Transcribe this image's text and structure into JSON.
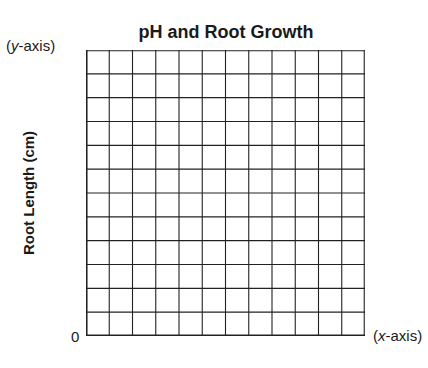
{
  "chart_data": {
    "type": "line",
    "title": "pH and Root Growth",
    "xlabel": "(x-axis)",
    "ylabel": "Root Length (cm)",
    "y_axis_tag": "(y-axis)",
    "origin_label": "0",
    "grid": true,
    "grid_columns": 12,
    "grid_rows": 12,
    "series": [],
    "categories": [],
    "values": []
  },
  "labels": {
    "title": "pH and Root Growth",
    "y_axis_tag": "(y-axis)",
    "x_axis_tag": "(x-axis)",
    "y_label": "Root Length (cm)",
    "origin": "0"
  },
  "colors": {
    "grid_line": "#222222",
    "background": "#ffffff"
  }
}
